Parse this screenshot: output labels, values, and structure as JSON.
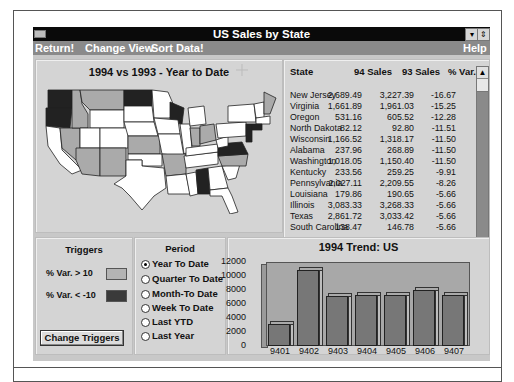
{
  "window": {
    "title": "US Sales by State",
    "menu": [
      "Return!",
      "Change View",
      "Sort Data!"
    ],
    "menu_right": "Help",
    "controls": {
      "minimize": "▾",
      "restore": "⇕"
    }
  },
  "map": {
    "title": "1994 vs 1993 - Year to Date",
    "cursor": "move-cursor"
  },
  "table": {
    "headers": [
      "State",
      "94 Sales",
      "93 Sales",
      "% Var."
    ],
    "rows": [
      {
        "state": "New Jersey",
        "s94": "2,689.49",
        "s93": "3,227.39",
        "var": "-16.67"
      },
      {
        "state": "Virginia",
        "s94": "1,661.89",
        "s93": "1,961.03",
        "var": "-15.25"
      },
      {
        "state": "Oregon",
        "s94": "531.16",
        "s93": "605.52",
        "var": "-12.28"
      },
      {
        "state": "North Dakota",
        "s94": "82.12",
        "s93": "92.80",
        "var": "-11.51"
      },
      {
        "state": "Wisconsin",
        "s94": "1,166.52",
        "s93": "1,318.17",
        "var": "-11.50"
      },
      {
        "state": "Alabama",
        "s94": "237.96",
        "s93": "268.89",
        "var": "-11.50"
      },
      {
        "state": "Washington",
        "s94": "1,018.05",
        "s93": "1,150.40",
        "var": "-11.50"
      },
      {
        "state": "Kentucky",
        "s94": "233.56",
        "s93": "259.25",
        "var": "-9.91"
      },
      {
        "state": "Pennsylvania",
        "s94": "2,027.11",
        "s93": "2,209.55",
        "var": "-8.26"
      },
      {
        "state": "Louisiana",
        "s94": "179.86",
        "s93": "190.65",
        "var": "-5.66"
      },
      {
        "state": "Illinois",
        "s94": "3,083.33",
        "s93": "3,268.33",
        "var": "-5.66"
      },
      {
        "state": "Texas",
        "s94": "2,861.72",
        "s93": "3,033.42",
        "var": "-5.66"
      },
      {
        "state": "South Carolina",
        "s94": "138.47",
        "s93": "146.78",
        "var": "-5.66"
      }
    ]
  },
  "triggers": {
    "title": "Triggers",
    "items": [
      {
        "label": "% Var. >  10",
        "color": "#b4b4b4"
      },
      {
        "label": "% Var. < -10",
        "color": "#3a3a3a"
      }
    ],
    "button": "Change Triggers"
  },
  "period": {
    "title": "Period",
    "options": [
      "Year To Date",
      "Quarter To Date",
      "Month-To Date",
      "Week To Date",
      "Last YTD",
      "Last Year"
    ],
    "selected": 0
  },
  "chart_data": {
    "type": "bar",
    "title": "1994 Trend: US",
    "categories": [
      "9401",
      "9402",
      "9403",
      "9404",
      "9405",
      "9406",
      "9407"
    ],
    "values": [
      3200,
      10800,
      7200,
      7300,
      7300,
      8000,
      7300
    ],
    "yticks": [
      "12000",
      "10000",
      "8000",
      "6000",
      "4000",
      "2000",
      "0"
    ],
    "ylim": [
      0,
      12000
    ],
    "xlabel": "",
    "ylabel": "",
    "style": "3d",
    "grid": false,
    "legend": "none"
  }
}
